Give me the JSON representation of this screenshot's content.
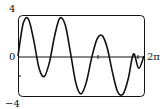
{
  "chart_data": {
    "type": "line",
    "title": "",
    "xlabel": "",
    "ylabel": "",
    "xlim": [
      0,
      6.2832
    ],
    "ylim": [
      -4,
      4
    ],
    "x_tick_labels": [
      "0",
      "2π"
    ],
    "y_tick_labels": [
      "4",
      "0",
      "−4"
    ],
    "grid": false,
    "legend": null,
    "series": [
      {
        "name": "f(x)",
        "x": [
          0,
          0.26,
          0.52,
          0.79,
          1.05,
          1.31,
          1.57,
          1.83,
          2.09,
          2.36,
          2.62,
          2.88,
          3.14,
          3.4,
          3.67,
          3.93,
          4.19,
          4.45,
          4.71,
          4.97,
          5.24,
          5.5,
          5.76,
          6.02,
          6.28
        ],
        "values": [
          0,
          3.2,
          3.6,
          1.5,
          -1.2,
          -2.0,
          -0.6,
          2.0,
          3.7,
          3.0,
          0.3,
          -2.6,
          -3.7,
          -2.6,
          -0.2,
          1.6,
          2.0,
          0.8,
          -1.6,
          -3.5,
          -3.7,
          -2.2,
          0.2,
          -1.2,
          0
        ]
      }
    ]
  },
  "labels": {
    "y_max": "4",
    "y_zero": "0",
    "y_min": "−4",
    "x_max": "2π"
  },
  "colors": {
    "curve": "#111111",
    "frame": "#111111",
    "axis": "#111111"
  }
}
